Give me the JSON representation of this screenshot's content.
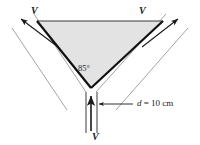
{
  "figure": {
    "title": "",
    "background_color": "#ffffff",
    "wedge": {
      "fill_color": "#e3e3e3",
      "edge_color": "#1a1a1a",
      "apex_angle_label": "85°",
      "apex_angle_value": 85,
      "vertices": {
        "top_left": [
          37,
          21
        ],
        "top_right": [
          163,
          21
        ],
        "apex_bottom": [
          91,
          88
        ]
      }
    },
    "inlet": {
      "velocity_label": "V",
      "diameter_label": "d = 10 cm",
      "diameter_symbol": "d",
      "diameter_value": "10",
      "diameter_units": "cm",
      "direction": "upward"
    },
    "outlets": [
      {
        "velocity_label": "V",
        "direction": "up-left"
      },
      {
        "velocity_label": "V",
        "direction": "up-right"
      }
    ],
    "stream_line_color": "#9a9a9a",
    "arrow_color": "#1a1a1a"
  }
}
